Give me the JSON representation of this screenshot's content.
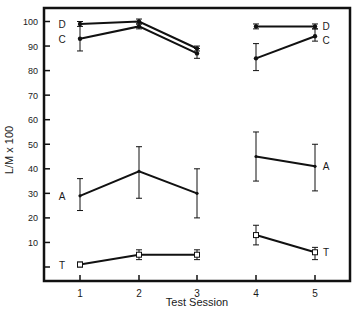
{
  "chart_data": {
    "type": "line",
    "title": "",
    "xlabel": "Test Session",
    "ylabel": "L/M x 100",
    "x": [
      1,
      2,
      3,
      4,
      5
    ],
    "xticks": [
      "1",
      "2",
      "3",
      "4",
      "5"
    ],
    "yticks": [
      10,
      20,
      30,
      40,
      50,
      60,
      70,
      80,
      90,
      100
    ],
    "ylim": [
      -2,
      104
    ],
    "grid": false,
    "legend": "inline labels at line ends",
    "segments_note": "Lines connect sessions 1-3 and sessions 4-5 separately (gap between 3 and 4)",
    "series": [
      {
        "name": "D",
        "marker": "filled",
        "values": [
          99,
          100,
          89,
          98,
          98
        ],
        "err_low": [
          98,
          99,
          88,
          97,
          97
        ],
        "err_high": [
          100,
          101,
          90,
          99,
          99
        ]
      },
      {
        "name": "C",
        "marker": "filled",
        "values": [
          93,
          98,
          87,
          85,
          94
        ],
        "err_low": [
          88,
          97,
          85,
          80,
          92
        ],
        "err_high": [
          100,
          99,
          89,
          91,
          97
        ]
      },
      {
        "name": "A",
        "marker": "dot",
        "values": [
          29,
          39,
          30,
          45,
          41
        ],
        "err_low": [
          23,
          28,
          20,
          35,
          31
        ],
        "err_high": [
          36,
          49,
          40,
          55,
          50
        ]
      },
      {
        "name": "T",
        "marker": "open-square",
        "values": [
          1,
          5,
          5,
          13,
          6
        ],
        "err_low": [
          0,
          3,
          3,
          9,
          3
        ],
        "err_high": [
          2,
          7,
          7,
          17,
          8
        ]
      }
    ],
    "labels": {
      "left": [
        "D",
        "C",
        "A",
        "T"
      ],
      "right": [
        "D",
        "C",
        "A",
        "T"
      ]
    }
  }
}
